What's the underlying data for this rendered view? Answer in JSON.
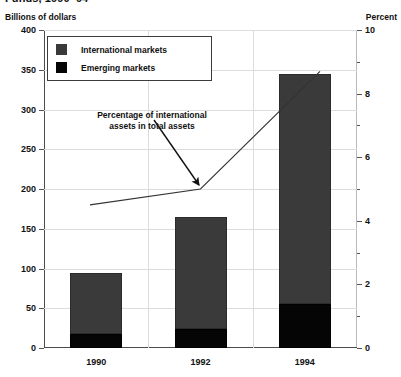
{
  "chart_title": "Funds, 1990–94",
  "axis_caption_left": "Billions of dollars",
  "axis_caption_right": "Percent",
  "legend": {
    "items": [
      {
        "label": "International markets",
        "color": "#3a3a3a",
        "swatch_name": "legend-swatch-international"
      },
      {
        "label": "Emerging markets",
        "color": "#050505",
        "swatch_name": "legend-swatch-emerging"
      }
    ]
  },
  "annotation": {
    "line1": "Percentage of international",
    "line2": "assets in total assets",
    "arrow_name": "annotation-arrow"
  },
  "chart_data": {
    "type": "bar",
    "title": "Funds, 1990–94",
    "xlabel": "",
    "ylabel": "Billions of dollars",
    "y2label": "Percent",
    "categories": [
      "1990",
      "1992",
      "1994"
    ],
    "ylim": [
      0,
      400
    ],
    "y2lim": [
      0,
      10
    ],
    "yticks": [
      0,
      50,
      100,
      150,
      200,
      250,
      300,
      350,
      400
    ],
    "ytick_labels": [
      "0",
      "50",
      "100",
      "150",
      "200",
      "250",
      "300",
      "350",
      "400"
    ],
    "y2ticks": [
      0,
      2,
      4,
      6,
      8,
      10
    ],
    "y2tick_labels": [
      "0",
      "2",
      "4",
      "6",
      "8",
      "10"
    ],
    "y2_minor_ticks": [
      1,
      3,
      5,
      7,
      9
    ],
    "grid": true,
    "legend_position": "upper-left-inside",
    "stacked": true,
    "series": [
      {
        "name": "Emerging markets",
        "color": "#050505",
        "values": [
          18,
          24,
          55
        ]
      },
      {
        "name": "International markets",
        "color": "#3a3a3a",
        "values": [
          76,
          141,
          290
        ]
      }
    ],
    "totals": [
      94,
      165,
      345
    ],
    "line_series": {
      "name": "Percentage of international assets in total assets",
      "axis": "right",
      "color": "#333333",
      "x": [
        "pre-1990",
        "1992",
        "post-1994"
      ],
      "values": [
        4.5,
        5.0,
        8.7
      ]
    }
  }
}
